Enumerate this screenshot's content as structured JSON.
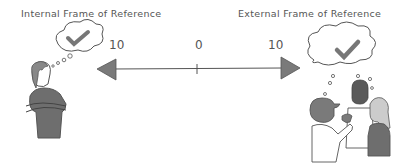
{
  "labels": {
    "internal": "Internal Frame of Reference",
    "external": "External Frame of Reference"
  },
  "scale": {
    "left": "10",
    "center": "0",
    "right": "10"
  },
  "colors": {
    "ink": "#555555",
    "fill_gray": "#7a7a7a"
  }
}
